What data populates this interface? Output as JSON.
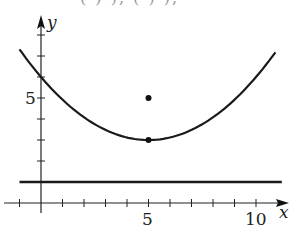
{
  "top_clipped_text": "( ) ),    ( ) ),",
  "chart_data": {
    "type": "line",
    "title": "",
    "xlabel": "x",
    "ylabel": "y",
    "xlim": [
      -1.8,
      11.5
    ],
    "ylim": [
      -1,
      8.6
    ],
    "grid": false,
    "x_tick_labels": [
      {
        "value": 5,
        "label": "5"
      },
      {
        "value": 10,
        "label": "10"
      }
    ],
    "y_tick_labels": [
      {
        "value": 5,
        "label": "5"
      }
    ],
    "x_ticks": [
      -1,
      1,
      2,
      3,
      4,
      5,
      6,
      7,
      8,
      9,
      10
    ],
    "y_ticks": [
      2,
      3,
      4,
      5,
      6,
      7,
      8
    ],
    "series": [
      {
        "name": "parabola",
        "kind": "curve",
        "equation_approx": "y = 3 + 0.12*(x-5)^2",
        "x": [
          -1,
          0,
          1,
          2,
          3,
          4,
          5,
          6,
          7,
          8,
          9,
          10,
          10.9
        ],
        "y": [
          7.32,
          6.0,
          4.92,
          4.08,
          3.48,
          3.12,
          3.0,
          3.12,
          3.48,
          4.08,
          4.92,
          6.0,
          7.18
        ]
      },
      {
        "name": "horizontal line",
        "kind": "line",
        "equation": "y = 1",
        "x": [
          -1,
          11.2
        ],
        "y": [
          1,
          1
        ]
      },
      {
        "name": "points",
        "kind": "scatter",
        "points": [
          {
            "x": 5,
            "y": 5
          },
          {
            "x": 5,
            "y": 3
          }
        ]
      }
    ],
    "legend": null
  },
  "labels": {
    "x_axis": "x",
    "y_axis": "y",
    "x5": "5",
    "x10": "10",
    "y5": "5"
  }
}
